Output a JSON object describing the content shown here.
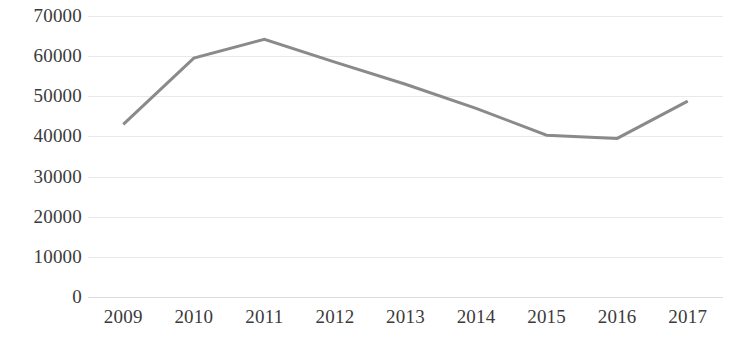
{
  "chart_data": {
    "type": "line",
    "title": "",
    "subtitle": "",
    "xlabel": "",
    "ylabel": "",
    "categories": [
      "2009",
      "2010",
      "2011",
      "2012",
      "2013",
      "2014",
      "2015",
      "2016",
      "2017"
    ],
    "values": [
      43000,
      59500,
      64200,
      58500,
      53000,
      47000,
      40300,
      39500,
      48800
    ],
    "series": [
      {
        "name": "",
        "values": [
          43000,
          59500,
          64200,
          58500,
          53000,
          47000,
          40300,
          39500,
          48800
        ],
        "color": "#8a8a8a"
      }
    ],
    "ylim": [
      0,
      70000
    ],
    "ytick_values": [
      0,
      10000,
      20000,
      30000,
      40000,
      50000,
      60000,
      70000
    ],
    "ytick_labels": [
      "0",
      "10000",
      "20000",
      "30000",
      "40000",
      "50000",
      "60000",
      "70000"
    ],
    "xtick_labels": [
      "2009",
      "2010",
      "2011",
      "2012",
      "2013",
      "2014",
      "2015",
      "2016",
      "2017"
    ],
    "grid": true,
    "grid_axis": "y",
    "grid_color": "#e9e9ec",
    "legend": false,
    "legend_position": "none",
    "markers": false,
    "line_width": 3,
    "annotations": []
  },
  "colors": {
    "background": "#ffffff",
    "line": "#8a8a8a",
    "gridline": "#e9e9ec",
    "baseline": "#dcdcdf",
    "tick_text": "#3b3b3b"
  }
}
